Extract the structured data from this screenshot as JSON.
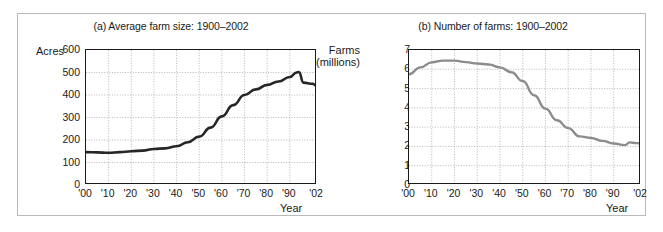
{
  "figure": {
    "panels": [
      {
        "id": "a",
        "title": "(a) Average farm size: 1900–2002",
        "y_axis_label_line1": "Acres",
        "y_axis_label_line2": "",
        "x_axis_label": "Year",
        "y_ticks": [
          "600",
          "500",
          "400",
          "300",
          "200",
          "100",
          "0"
        ],
        "x_ticks": [
          "'00",
          "'10",
          "'20",
          "'30",
          "'40",
          "'50",
          "'60",
          "'70",
          "'80",
          "'90",
          "'02"
        ],
        "line_color": "#262626"
      },
      {
        "id": "b",
        "title": "(b) Number of farms: 1900–2002",
        "y_axis_label_line1": "Farms",
        "y_axis_label_line2": "(millions)",
        "x_axis_label": "Year",
        "y_ticks": [
          "7",
          "6",
          "5",
          "4",
          "3",
          "2",
          "1",
          "0"
        ],
        "x_ticks": [
          "'00",
          "'10",
          "'20",
          "'30",
          "'40",
          "'50",
          "'60",
          "'70",
          "'80",
          "'90",
          "'02"
        ],
        "line_color": "#8c8c8c"
      }
    ]
  },
  "chart_data": [
    {
      "type": "line",
      "title": "(a) Average farm size: 1900–2002",
      "xlabel": "Year",
      "ylabel": "Acres",
      "xlim": [
        1900,
        2002
      ],
      "ylim": [
        0,
        600
      ],
      "ytick_values": [
        0,
        100,
        200,
        300,
        400,
        500,
        600
      ],
      "xtick_values": [
        1900,
        1910,
        1920,
        1930,
        1940,
        1950,
        1960,
        1970,
        1980,
        1990,
        2002
      ],
      "xtick_labels": [
        "'00",
        "'10",
        "'20",
        "'30",
        "'40",
        "'50",
        "'60",
        "'70",
        "'80",
        "'90",
        "'02"
      ],
      "grid": true,
      "legend": "none",
      "series": [
        {
          "name": "Average farm size (acres)",
          "x": [
            1900,
            1905,
            1910,
            1915,
            1920,
            1925,
            1930,
            1935,
            1940,
            1945,
            1950,
            1955,
            1960,
            1965,
            1970,
            1975,
            1980,
            1985,
            1990,
            1993,
            1994,
            1996,
            2000,
            2002
          ],
          "values": [
            146,
            145,
            143,
            146,
            150,
            153,
            160,
            163,
            172,
            190,
            215,
            255,
            305,
            355,
            400,
            425,
            445,
            460,
            480,
            500,
            502,
            455,
            450,
            440
          ]
        }
      ]
    },
    {
      "type": "line",
      "title": "(b) Number of farms: 1900–2002",
      "xlabel": "Year",
      "ylabel": "Farms (millions)",
      "xlim": [
        1900,
        2002
      ],
      "ylim": [
        0,
        7
      ],
      "ytick_values": [
        0,
        1,
        2,
        3,
        4,
        5,
        6,
        7
      ],
      "xtick_values": [
        1900,
        1910,
        1920,
        1930,
        1940,
        1950,
        1960,
        1970,
        1980,
        1990,
        2002
      ],
      "xtick_labels": [
        "'00",
        "'10",
        "'20",
        "'30",
        "'40",
        "'50",
        "'60",
        "'70",
        "'80",
        "'90",
        "'02"
      ],
      "grid": true,
      "legend": "none",
      "series": [
        {
          "name": "Number of farms (millions)",
          "x": [
            1900,
            1905,
            1910,
            1915,
            1920,
            1925,
            1930,
            1935,
            1940,
            1945,
            1950,
            1955,
            1960,
            1965,
            1970,
            1975,
            1980,
            1985,
            1990,
            1995,
            1997,
            2000,
            2002
          ],
          "values": [
            5.74,
            6.1,
            6.36,
            6.45,
            6.45,
            6.37,
            6.3,
            6.25,
            6.1,
            5.85,
            5.39,
            4.65,
            3.96,
            3.36,
            2.95,
            2.52,
            2.44,
            2.29,
            2.15,
            2.07,
            2.21,
            2.17,
            2.16
          ]
        }
      ]
    }
  ]
}
